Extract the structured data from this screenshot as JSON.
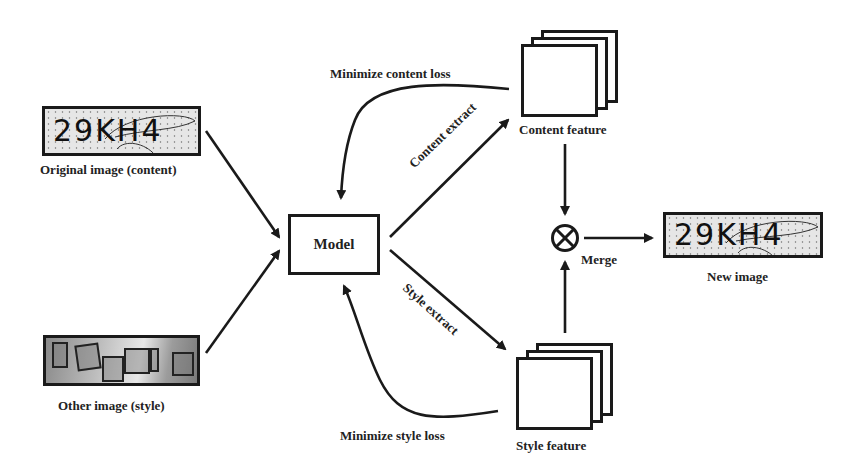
{
  "diagram": {
    "nodes": {
      "original_image": {
        "label": "Original image (content)",
        "captcha_text": "29KH4"
      },
      "other_image": {
        "label": "Other image (style)"
      },
      "model": {
        "label": "Model"
      },
      "content_feature": {
        "label": "Content feature"
      },
      "style_feature": {
        "label": "Style feature"
      },
      "merge": {
        "label": "Merge",
        "symbol": "⊗"
      },
      "new_image": {
        "label": "New image",
        "captcha_text": "29KH4"
      }
    },
    "edges": {
      "content_extract": "Content extract",
      "style_extract": "Style extract",
      "minimize_content_loss": "Minimize content loss",
      "minimize_style_loss": "Minimize style loss"
    }
  }
}
